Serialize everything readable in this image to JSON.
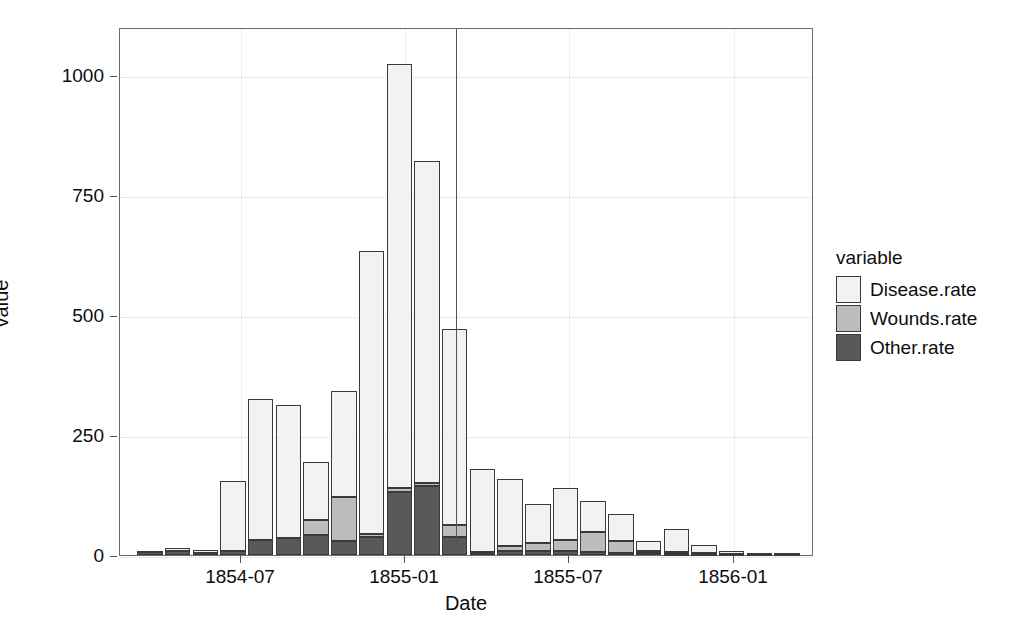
{
  "chart_data": {
    "type": "bar",
    "subtype": "stacked-bar",
    "title": "",
    "xlabel": "Date",
    "ylabel": "value",
    "grid": true,
    "legend_position": "right",
    "legend_title": "variable",
    "ylim": [
      0,
      1100
    ],
    "yticks": [
      0,
      250,
      500,
      750,
      1000
    ],
    "ytick_labels": [
      "0",
      "250",
      "500",
      "750",
      "1000"
    ],
    "xtick_labels": [
      "1854-07",
      "1855-01",
      "1855-07",
      "1856-01"
    ],
    "xtick_positions": [
      240,
      404,
      568,
      733
    ],
    "categories": [
      "1854-04",
      "1854-05",
      "1854-06",
      "1854-07",
      "1854-08",
      "1854-09",
      "1854-10",
      "1854-11",
      "1854-12",
      "1855-01",
      "1855-02",
      "1855-03",
      "1855-04",
      "1855-05",
      "1855-06",
      "1855-07",
      "1855-08",
      "1855-09",
      "1855-10",
      "1855-11",
      "1855-12",
      "1856-01",
      "1856-02",
      "1856-03"
    ],
    "series": [
      {
        "name": "Disease.rate",
        "color": "#f2f2f2",
        "values": [
          1.4,
          6.2,
          4.6,
          146.0,
          292.7,
          277.1,
          121.0,
          222.0,
          590.7,
          883.4,
          672.1,
          408.1,
          172.2,
          140.1,
          80.3,
          107.5,
          63.8,
          54.8,
          21.7,
          47.1,
          17.4,
          5.7,
          3.0,
          2.5
        ]
      },
      {
        "name": "Wounds.rate",
        "color": "#bdbdbd",
        "values": [
          0.0,
          0.0,
          0.0,
          0.0,
          0.0,
          0.0,
          30.7,
          91.5,
          6.5,
          9.0,
          6.1,
          24.2,
          1.5,
          10.0,
          17.4,
          23.8,
          42.6,
          25.4,
          4.6,
          4.1,
          1.6,
          0.3,
          0.2,
          0.1
        ]
      },
      {
        "name": "Other.rate",
        "color": "#595959",
        "values": [
          7.4,
          8.0,
          5.0,
          8.5,
          31.4,
          36.3,
          42.1,
          28.5,
          36.7,
          130.4,
          143.1,
          37.5,
          5.2,
          8.3,
          8.2,
          7.3,
          6.0,
          4.5,
          3.3,
          2.1,
          2.7,
          2.0,
          1.8,
          1.5
        ]
      }
    ],
    "annotations": [
      {
        "type": "vline",
        "name": "sanitary-commission-reference-line",
        "x_category": "1855-03",
        "x_px": 455,
        "color": "#555555"
      }
    ]
  },
  "legend": {
    "title": "variable",
    "entries": [
      {
        "label": "Disease.rate",
        "color": "#f2f2f2"
      },
      {
        "label": "Wounds.rate",
        "color": "#bdbdbd"
      },
      {
        "label": "Other.rate",
        "color": "#595959"
      }
    ]
  }
}
